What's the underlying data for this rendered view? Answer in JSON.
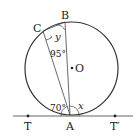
{
  "diagram": {
    "type": "circle-tangent-geometry",
    "colors": {
      "stroke": "#333333",
      "tangent": "#666666",
      "text": "#222222",
      "background": "#ffffff"
    },
    "circle": {
      "center_label": "O",
      "cx": 71.5,
      "cy": 68.5,
      "r": 46.5
    },
    "points": {
      "A": {
        "label": "A",
        "x": 70,
        "y": 115
      },
      "B": {
        "label": "B",
        "x": 65,
        "y": 22
      },
      "C": {
        "label": "C",
        "x": 43,
        "y": 31
      },
      "O": {
        "label": "O",
        "x": 72,
        "y": 68
      },
      "T": {
        "label": "T",
        "x": 28,
        "y": 116
      },
      "T_prime": {
        "label": "T′",
        "x": 115,
        "y": 116
      }
    },
    "segments": [
      "AB",
      "AC",
      "CB",
      "TT′ (tangent at A)"
    ],
    "angles": {
      "CAT": {
        "label": "70°",
        "value_deg": 70
      },
      "ACB_marker": {
        "label": "95°",
        "value_deg": 95
      },
      "BAT_prime": {
        "label": "x",
        "unknown": true
      },
      "CBA": {
        "label": "y",
        "unknown": true
      }
    }
  }
}
